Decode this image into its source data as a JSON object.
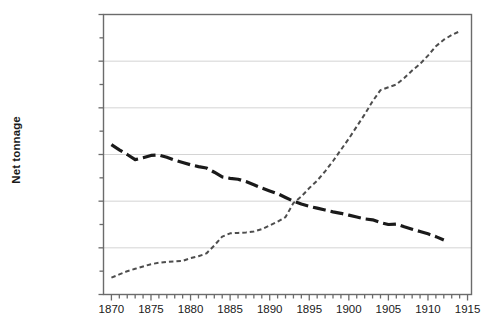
{
  "chart_data": {
    "type": "line",
    "title": "",
    "subtitle": "",
    "xlabel": "",
    "ylabel": "Net tonnage",
    "xlim": [
      1869,
      1915.5
    ],
    "ylim": [
      0,
      30000000
    ],
    "grid": "horizontal",
    "legend_position": "none",
    "y_ticks": [
      0,
      5000000,
      10000000,
      15000000,
      20000000,
      25000000,
      30000000
    ],
    "y_tick_labels": [
      "0",
      "5,000,000",
      "10,000,000",
      "15,000,000",
      "20,000,000",
      "25,000,000",
      "30,000,000"
    ],
    "y_minor_ticks": [
      2500000,
      7500000,
      12500000,
      17500000,
      22500000,
      27500000
    ],
    "x_ticks": [
      1870,
      1875,
      1880,
      1885,
      1890,
      1895,
      1900,
      1905,
      1910,
      1915
    ],
    "x_tick_labels": [
      "1870",
      "1875",
      "1880",
      "1885",
      "1890",
      "1895",
      "1900",
      "1905",
      "1910",
      "1915"
    ],
    "x_minor_tick_interval": 1,
    "series": [
      {
        "name": "sail",
        "style": "dashed-thick",
        "color": "#1a1a1a",
        "linewidth": 3.2,
        "x": [
          1870,
          1871,
          1872,
          1873,
          1874,
          1875,
          1876,
          1877,
          1878,
          1879,
          1880,
          1881,
          1882,
          1883,
          1884,
          1885,
          1886,
          1887,
          1888,
          1889,
          1890,
          1891,
          1892,
          1893,
          1894,
          1895,
          1896,
          1897,
          1898,
          1899,
          1900,
          1901,
          1902,
          1903,
          1904,
          1905,
          1906,
          1907,
          1908,
          1909,
          1910,
          1911,
          1912
        ],
        "values": [
          16050000,
          15500000,
          15000000,
          14450000,
          14650000,
          14900000,
          14950000,
          14700000,
          14400000,
          14150000,
          13900000,
          13700000,
          13550000,
          13100000,
          12600000,
          12450000,
          12350000,
          12100000,
          11750000,
          11400000,
          11100000,
          10800000,
          10400000,
          10000000,
          9700000,
          9450000,
          9250000,
          9050000,
          8850000,
          8700000,
          8500000,
          8300000,
          8100000,
          8000000,
          7700000,
          7500000,
          7550000,
          7250000,
          7000000,
          6750000,
          6500000,
          6200000,
          5850000
        ]
      },
      {
        "name": "steam",
        "style": "dashed-thin",
        "color": "#4d4d4d",
        "linewidth": 2.0,
        "x": [
          1870,
          1871,
          1872,
          1873,
          1874,
          1875,
          1876,
          1877,
          1878,
          1879,
          1880,
          1881,
          1882,
          1883,
          1884,
          1885,
          1886,
          1887,
          1888,
          1889,
          1890,
          1891,
          1892,
          1893,
          1894,
          1895,
          1896,
          1897,
          1898,
          1899,
          1900,
          1901,
          1902,
          1903,
          1904,
          1905,
          1906,
          1907,
          1908,
          1909,
          1910,
          1911,
          1912,
          1913,
          1914
        ],
        "values": [
          1800000,
          2150000,
          2500000,
          2750000,
          3000000,
          3250000,
          3400000,
          3500000,
          3550000,
          3600000,
          3900000,
          4100000,
          4400000,
          5250000,
          6200000,
          6550000,
          6600000,
          6650000,
          6750000,
          7000000,
          7400000,
          7800000,
          8300000,
          9800000,
          10500000,
          11400000,
          12200000,
          13200000,
          14300000,
          15500000,
          16700000,
          18000000,
          19300000,
          20700000,
          21900000,
          22200000,
          22500000,
          23200000,
          24000000,
          24700000,
          25600000,
          26600000,
          27300000,
          27800000,
          28200000
        ]
      }
    ]
  }
}
